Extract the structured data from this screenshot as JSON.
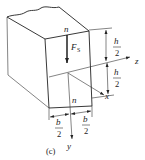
{
  "diagram": {
    "caption": "(c)",
    "section_label_top": "n",
    "section_label_bottom": "n",
    "force_label": "F",
    "force_subscript": "S",
    "axes": {
      "x": "x",
      "y": "y",
      "z": "z"
    },
    "height_dims": [
      {
        "num": "h",
        "den": "2"
      },
      {
        "num": "h",
        "den": "2"
      }
    ],
    "width_dims": [
      {
        "num": "b",
        "den": "2"
      },
      {
        "num": "b",
        "den": "2"
      }
    ]
  }
}
